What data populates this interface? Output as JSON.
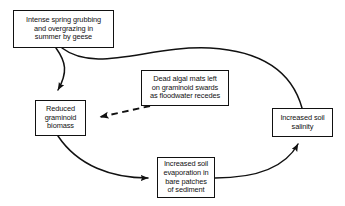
{
  "diagram": {
    "type": "causal-loop-flow-diagram",
    "background_color": "#ffffff",
    "line_color": "#111111",
    "nodes": [
      {
        "id": "grubbing",
        "label": "Intense spring grubbing\nand overgrazing in\nsummer by geese"
      },
      {
        "id": "graminoid",
        "label": "Reduced\ngraminoid\nbiomass"
      },
      {
        "id": "algal",
        "label": "Dead algal mats left\non graminoid swards\nas floodwater recedes"
      },
      {
        "id": "salinity",
        "label": "Increased soil\nsalinity"
      },
      {
        "id": "evaporation",
        "label": "Increased soil\nevaporation in\nbare patches\nof sediment"
      }
    ],
    "edges": [
      {
        "id": "grubbing-to-graminoid",
        "from": "grubbing",
        "to": "graminoid",
        "style": "solid",
        "arrowhead": "filled-triangle"
      },
      {
        "id": "grubbing-to-salinity",
        "from": "grubbing",
        "to": "salinity",
        "style": "solid",
        "arrowhead": "none"
      },
      {
        "id": "algal-to-graminoid",
        "from": "algal",
        "to": "graminoid",
        "style": "dashed",
        "arrowhead": "filled-triangle"
      },
      {
        "id": "graminoid-to-evaporation",
        "from": "graminoid",
        "to": "evaporation",
        "style": "solid",
        "arrowhead": "filled-triangle"
      },
      {
        "id": "evaporation-to-salinity",
        "from": "evaporation",
        "to": "salinity",
        "style": "solid",
        "arrowhead": "filled-triangle"
      }
    ]
  }
}
